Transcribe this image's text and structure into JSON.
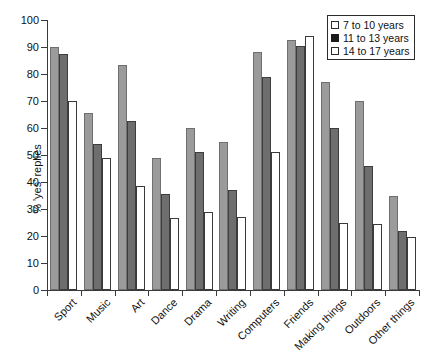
{
  "chart_data": {
    "type": "bar",
    "title": "",
    "xlabel": "",
    "ylabel": "% 'yes' replies",
    "ylim": [
      0,
      100
    ],
    "yticks": [
      0,
      10,
      20,
      30,
      40,
      50,
      60,
      70,
      80,
      90,
      100
    ],
    "grid": false,
    "legend_position": "top-right",
    "categories": [
      "Sport",
      "Music",
      "Art",
      "Dance",
      "Drama",
      "Writing",
      "Computers",
      "Friends",
      "Making things",
      "Outdoors",
      "Other things"
    ],
    "series": [
      {
        "name": "7 to 10 years",
        "color": "#9b9b9b",
        "values": [
          90,
          65.5,
          83.5,
          49,
          60,
          55,
          88,
          92.5,
          77,
          70,
          35
        ]
      },
      {
        "name": "11 to 13 years",
        "color": "#6e6e6e",
        "values": [
          87.5,
          54,
          62.5,
          35.5,
          51,
          37,
          79,
          90.5,
          60,
          46,
          22
        ]
      },
      {
        "name": "14 to 17 years",
        "color": "#ffffff",
        "values": [
          70,
          49,
          38.5,
          26.5,
          29,
          27,
          51,
          94,
          25,
          24.5,
          19.5
        ]
      }
    ]
  },
  "legend": {
    "items": [
      {
        "label": "7 to 10 years",
        "swatch": "open-square"
      },
      {
        "label": "11 to 13 years",
        "swatch": "filled-square"
      },
      {
        "label": "14 to 17 years",
        "swatch": "open-square"
      }
    ]
  },
  "colors": {
    "series_1": "#9b9b9b",
    "series_2": "#6e6e6e",
    "series_3": "#ffffff",
    "axis": "#3a3a3a",
    "text": "#111111",
    "background": "#ffffff"
  }
}
